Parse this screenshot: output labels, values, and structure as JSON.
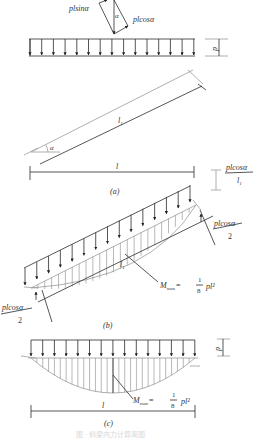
{
  "figure": {
    "force_decomposition": {
      "component_parallel": "plsinα",
      "component_normal": "plcosα",
      "angle": "α"
    },
    "load_intensity": "p",
    "panel_a": {
      "label": "(a)",
      "angle": "α",
      "inclined_length": "l",
      "inclined_length_sub": "1",
      "horizontal_span": "l",
      "reaction_label_num": "plcosα",
      "reaction_label_den": "l",
      "reaction_label_den_sub": "1"
    },
    "panel_b": {
      "label": "(b)",
      "inclined_length": "l",
      "inclined_length_sub": "1",
      "right_reaction_num": "plcosα",
      "right_reaction_den": "2",
      "left_reaction_num": "plcosα",
      "left_reaction_den": "2",
      "moment_label": "M",
      "moment_sub": "max",
      "moment_eq": "=",
      "moment_frac_num": "1",
      "moment_frac_den": "8",
      "moment_tail": "pl²"
    },
    "panel_c": {
      "label": "(c)",
      "load_intensity": "p",
      "span": "l",
      "moment_label": "M",
      "moment_sub": "max",
      "moment_eq": "=",
      "moment_frac_num": "1",
      "moment_frac_den": "8",
      "moment_tail": "pl²"
    },
    "caption": "图 · 斜梁内力计算简图"
  }
}
